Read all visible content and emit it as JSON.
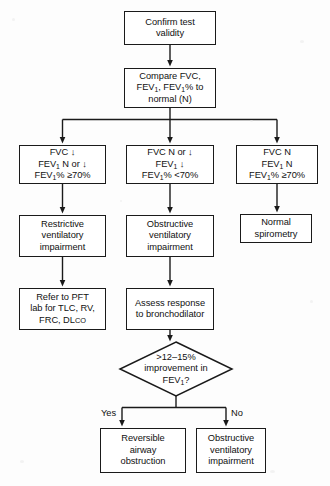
{
  "diagram": {
    "type": "flowchart",
    "background_color": "#fdfdfd",
    "line_color": "#1a1a1a",
    "text_color": "#111111",
    "nodes": [
      {
        "id": "confirm",
        "shape": "rect",
        "lines": [
          "Confirm test",
          "validity"
        ],
        "x": 124,
        "y": 11,
        "w": 92,
        "h": 34
      },
      {
        "id": "compare",
        "shape": "rect",
        "lines": [
          "Compare FVC,",
          "FEV<sub>1</sub>, FEV<sub>1</sub>% to",
          "normal (N)"
        ],
        "x": 124,
        "y": 68,
        "w": 92,
        "h": 40
      },
      {
        "id": "cond-restrictive",
        "shape": "rect",
        "lines": [
          "FVC ↓",
          "FEV<sub>1</sub> N or ↓",
          "FEV<sub>1</sub>% ≥70%"
        ],
        "x": 19,
        "y": 145,
        "w": 87,
        "h": 39
      },
      {
        "id": "cond-obstructive",
        "shape": "rect",
        "lines": [
          "FVC N or ↓",
          "FEV<sub>1</sub> ↓",
          "FEV<sub>1</sub>% <70%"
        ],
        "x": 126,
        "y": 145,
        "w": 88,
        "h": 39
      },
      {
        "id": "cond-normal",
        "shape": "rect",
        "lines": [
          "FVC N",
          "FEV<sub>1</sub> N",
          "FEV<sub>1</sub>% ≥70%"
        ],
        "x": 236,
        "y": 145,
        "w": 82,
        "h": 39
      },
      {
        "id": "restrictive-impairment",
        "shape": "rect",
        "lines": [
          "Restrictive",
          "ventilatory",
          "impairment"
        ],
        "x": 19,
        "y": 215,
        "w": 87,
        "h": 42
      },
      {
        "id": "obstructive-impairment",
        "shape": "rect",
        "lines": [
          "Obstructive",
          "ventilatory",
          "impairment"
        ],
        "x": 126,
        "y": 215,
        "w": 88,
        "h": 42
      },
      {
        "id": "normal-spirometry",
        "shape": "rect",
        "lines": [
          "Normal",
          "spirometry"
        ],
        "x": 240,
        "y": 214,
        "w": 72,
        "h": 29
      },
      {
        "id": "refer-pft",
        "shape": "rect",
        "lines": [
          "Refer to PFT",
          "lab for TLC, RV,",
          "FRC, DL<span class=\"sc\">CO</span>"
        ],
        "x": 19,
        "y": 288,
        "w": 87,
        "h": 42
      },
      {
        "id": "assess-response",
        "shape": "rect",
        "lines": [
          "Assess response",
          "to bronchodilator"
        ],
        "x": 126,
        "y": 288,
        "w": 88,
        "h": 42
      },
      {
        "id": "decision-improvement",
        "shape": "diamond",
        "lines": [
          ">12–15%",
          "improvement in",
          "FEV<sub>1</sub>?"
        ],
        "x": 120,
        "y": 342,
        "w": 112,
        "h": 54
      },
      {
        "id": "reversible-airway",
        "shape": "rect",
        "lines": [
          "Reversible",
          "airway",
          "obstruction"
        ],
        "x": 100,
        "y": 428,
        "w": 86,
        "h": 45
      },
      {
        "id": "obstructive-impairment-2",
        "shape": "rect",
        "lines": [
          "Obstructive",
          "ventilatory",
          "impairment"
        ],
        "x": 196,
        "y": 428,
        "w": 70,
        "h": 45
      }
    ],
    "edge_labels": [
      {
        "id": "yes-label",
        "text": "Yes",
        "x": 101,
        "y": 408
      },
      {
        "id": "no-label",
        "text": "No",
        "x": 231,
        "y": 408
      }
    ]
  }
}
